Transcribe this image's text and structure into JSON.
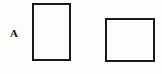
{
  "figure": {
    "type": "geometric-diagram",
    "canvas": {
      "width": 162,
      "height": 74,
      "background": "#fdfdfb"
    },
    "label": {
      "text": "A",
      "x": 10,
      "y": 28,
      "font_size": 11,
      "bold": true,
      "color": "#141414"
    },
    "shapes": [
      {
        "name": "rectangle-left",
        "shape": "rectangle",
        "x": 32,
        "y": 3,
        "width": 39,
        "height": 58,
        "stroke": "#1a1a1a",
        "stroke_width": 2,
        "fill": "#fdfdfb"
      },
      {
        "name": "rectangle-right",
        "shape": "rectangle",
        "x": 105,
        "y": 18,
        "width": 50,
        "height": 44,
        "stroke": "#1a1a1a",
        "stroke_width": 2,
        "fill": "#fdfdfb"
      }
    ]
  }
}
